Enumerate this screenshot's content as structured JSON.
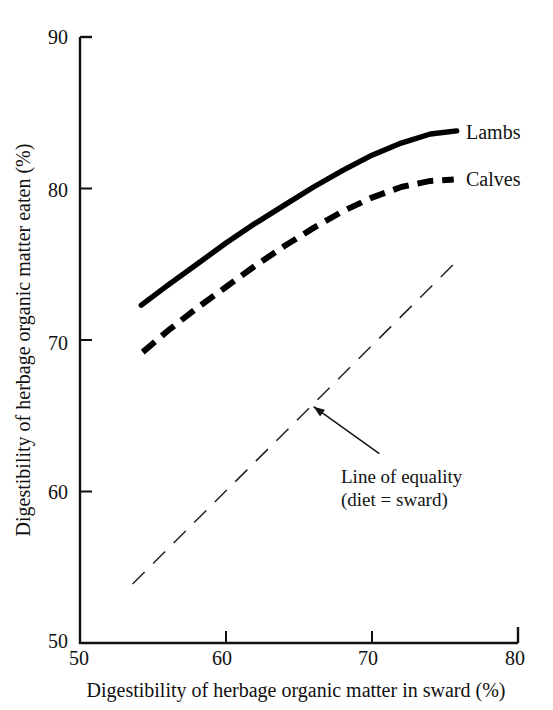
{
  "chart_data": {
    "type": "line",
    "title": "",
    "xlabel": "Digestibility of herbage organic matter in sward (%)",
    "ylabel": "Digestibility of herbage organic matter eaten (%)",
    "xlim": [
      50,
      80
    ],
    "ylim": [
      50,
      90
    ],
    "xticks": [
      50,
      60,
      70,
      80
    ],
    "yticks": [
      50,
      60,
      70,
      80,
      90
    ],
    "xtick_labels": [
      "50",
      "60",
      "70",
      "80"
    ],
    "ytick_labels": [
      "50",
      "60",
      "70",
      "80",
      "90"
    ],
    "grid": false,
    "legend_position": "inline-right-of-curve-ends",
    "series": [
      {
        "name": "Lambs",
        "style": "solid",
        "linewidth": 4.5,
        "color": "#000000",
        "x": [
          54.2,
          56,
          58,
          60,
          62,
          64,
          66,
          68,
          70,
          72,
          74,
          75.8
        ],
        "y": [
          72.3,
          73.6,
          75.0,
          76.4,
          77.7,
          78.9,
          80.1,
          81.2,
          82.2,
          83.0,
          83.6,
          83.8
        ]
      },
      {
        "name": "Calves",
        "style": "dashed",
        "linewidth": 4.5,
        "color": "#000000",
        "x": [
          54.3,
          56,
          58,
          60,
          62,
          64,
          66,
          68,
          70,
          72,
          74,
          75.6
        ],
        "y": [
          69.2,
          70.6,
          72.1,
          73.5,
          74.9,
          76.2,
          77.4,
          78.5,
          79.4,
          80.1,
          80.5,
          80.6
        ]
      },
      {
        "name": "Line of equality (diet = sward)",
        "style": "long-dashed",
        "linewidth": 1.4,
        "color": "#222222",
        "x": [
          53.6,
          75.9
        ],
        "y": [
          53.9,
          75.3
        ]
      }
    ],
    "annotations": [
      {
        "text_line1": "Line of equality",
        "text_line2": "(diet = sward)",
        "arrow_from_x": 70.5,
        "arrow_from_y": 62.5,
        "arrow_to_x": 66.0,
        "arrow_to_y": 65.6
      }
    ],
    "series_labels": [
      {
        "label": "Lambs",
        "at_x": 77.0,
        "at_y": 83.5
      },
      {
        "label": "Calves",
        "at_x": 77.0,
        "at_y": 80.4
      }
    ]
  },
  "axis": {
    "y_ticks": [
      {
        "label": "90"
      },
      {
        "label": "80"
      },
      {
        "label": "70"
      },
      {
        "label": "60"
      },
      {
        "label": "50"
      }
    ],
    "x_ticks": [
      {
        "label": "50"
      },
      {
        "label": "60"
      },
      {
        "label": "70"
      },
      {
        "label": "80"
      }
    ],
    "x_title": "Digestibility of herbage organic matter in sward (%)",
    "y_title": "Digestibility of herbage organic matter eaten (%)"
  },
  "labels": {
    "lambs": "Lambs",
    "calves": "Calves",
    "equality_line1": "Line of equality",
    "equality_line2": "(diet = sward)"
  }
}
